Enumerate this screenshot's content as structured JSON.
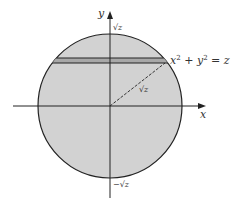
{
  "diagram": {
    "title": "",
    "axes": {
      "x_label": "x",
      "y_label": "y"
    },
    "circle": {
      "equation_label": "x² + y² = z",
      "equation_parts": {
        "x": "x",
        "x_exp": "2",
        "plus": "+",
        "y": "y",
        "y_exp": "2",
        "eq": "= z"
      },
      "radius_label": "√z",
      "top_intercept_label": "√z",
      "bottom_intercept_label": "−√z",
      "fill_color": "#d2d2d2",
      "stroke_color": "#222222"
    },
    "strip": {
      "fill_color": "#9a9a9a",
      "description": "thin horizontal strip near top of disk"
    }
  }
}
